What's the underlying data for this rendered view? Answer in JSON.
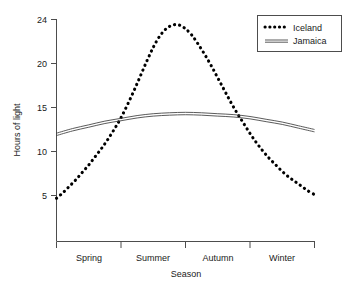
{
  "chart_data": {
    "type": "line",
    "title": "",
    "xlabel": "Season",
    "ylabel": "Hours of light",
    "categories": [
      "Spring",
      "Summer",
      "Autumn",
      "Winter"
    ],
    "x_tick_labels": [
      "Spring",
      "Summer",
      "Autumn",
      "Winter"
    ],
    "y_tick_labels": [
      "5",
      "10",
      "15",
      "20",
      "24"
    ],
    "y_ticks": [
      5,
      10,
      15,
      20,
      24
    ],
    "ylim": [
      0,
      24
    ],
    "grid": false,
    "legend_position": "top-right",
    "series": [
      {
        "name": "Iceland",
        "style": "dotted",
        "color": "#000000",
        "x": [
          0.0,
          0.1,
          0.2,
          0.3,
          0.4,
          0.5,
          0.6,
          0.7,
          0.8,
          0.9,
          1.0,
          1.1,
          1.2,
          1.3,
          1.4,
          1.5,
          1.6,
          1.7,
          1.8,
          1.9,
          2.0,
          2.1,
          2.2,
          2.3,
          2.4,
          2.5,
          2.6,
          2.7,
          2.8,
          2.9,
          3.0,
          3.1,
          3.2,
          3.3,
          3.4,
          3.5,
          3.6,
          3.7,
          3.8,
          3.9,
          4.0
        ],
        "values": [
          4.7,
          5.3,
          6.0,
          6.7,
          7.5,
          8.3,
          9.2,
          10.1,
          11.1,
          12.2,
          13.4,
          14.8,
          16.3,
          17.9,
          19.5,
          21.0,
          22.2,
          23.0,
          23.4,
          23.4,
          23.0,
          22.3,
          21.3,
          20.2,
          19.0,
          17.7,
          16.4,
          15.1,
          13.9,
          12.8,
          11.7,
          10.7,
          9.8,
          9.0,
          8.3,
          7.6,
          7.0,
          6.5,
          6.0,
          5.5,
          5.1
        ]
      },
      {
        "name": "Jamaica",
        "style": "solid-double",
        "color": "#3d3d3d",
        "x": [
          0.0,
          0.25,
          0.5,
          0.75,
          1.0,
          1.25,
          1.5,
          1.75,
          2.0,
          2.25,
          2.5,
          2.75,
          3.0,
          3.25,
          3.5,
          3.75,
          4.0
        ],
        "values": [
          11.6,
          12.1,
          12.5,
          12.9,
          13.2,
          13.5,
          13.7,
          13.8,
          13.85,
          13.8,
          13.7,
          13.6,
          13.4,
          13.1,
          12.8,
          12.4,
          12.0
        ]
      }
    ],
    "legend": [
      {
        "label": "Iceland",
        "style": "dotted"
      },
      {
        "label": "Jamaica",
        "style": "solid-double"
      }
    ]
  }
}
